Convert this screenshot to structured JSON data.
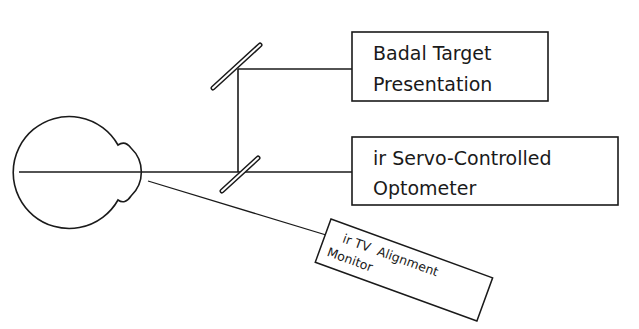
{
  "diagram": {
    "type": "optical-setup",
    "components": {
      "eye": {
        "label": ""
      },
      "badal": {
        "line1": "Badal Target",
        "line2": "Presentation"
      },
      "optometer": {
        "line1": "ir Servo-Controlled",
        "line2": "Optometer"
      },
      "tv_monitor": {
        "line1": "ir TV  Alignment",
        "line2": "Monitor"
      }
    },
    "colors": {
      "stroke": "#1a1a1a",
      "background": "#ffffff"
    }
  }
}
